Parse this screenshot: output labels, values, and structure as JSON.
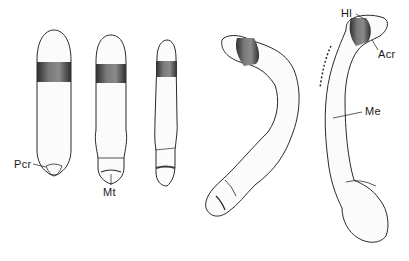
{
  "figure": {
    "specimen_count": 5,
    "labels": {
      "pcr": "Pcr",
      "mt": "Mt",
      "hl": "Hl",
      "acr": "Acr",
      "me": "Me"
    },
    "colors": {
      "outline": "#2a2a2a",
      "band": "#3a3a3a",
      "band_light": "#8a8a8a",
      "background": "#ffffff"
    }
  }
}
